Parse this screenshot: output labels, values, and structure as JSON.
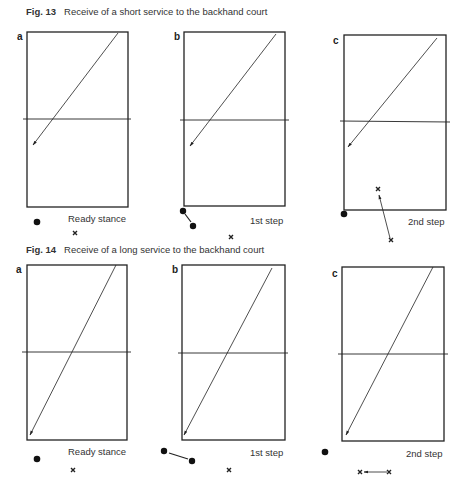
{
  "figures": [
    {
      "number": "Fig. 13",
      "caption": "Receive of a short service to the backhand court",
      "panels": [
        {
          "letter": "a",
          "label": "Ready stance"
        },
        {
          "letter": "b",
          "label": "1st step"
        },
        {
          "letter": "c",
          "label": "2nd step"
        }
      ]
    },
    {
      "number": "Fig. 14",
      "caption": "Receive of a long service to the backhand court",
      "panels": [
        {
          "letter": "a",
          "label": "Ready stance"
        },
        {
          "letter": "b",
          "label": "1st step"
        },
        {
          "letter": "c",
          "label": "2nd step"
        }
      ]
    }
  ],
  "legend_symbols": {
    "player": "filled-circle",
    "opponent": "x-mark",
    "shuttle_path": "arrow",
    "net": "horizontal-line"
  },
  "colors": {
    "ink": "#222222",
    "background": "#ffffff"
  }
}
